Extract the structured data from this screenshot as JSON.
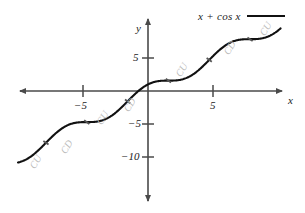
{
  "figure": {
    "title": "",
    "legend": {
      "label": "x + cos x",
      "swatch_color": "#111111",
      "position": "top-right"
    },
    "axes": {
      "x_label": "x",
      "y_label": "y",
      "x_ticks": [
        {
          "value": -5,
          "label": "−5"
        },
        {
          "value": 5,
          "label": "5"
        }
      ],
      "y_ticks": [
        {
          "value": 5,
          "label": "5"
        },
        {
          "value": -5,
          "label": "−5"
        },
        {
          "value": -10,
          "label": "−10"
        }
      ],
      "origin_px": {
        "x": 148,
        "y": 91
      },
      "px_per_unit_x": 13.0,
      "px_per_unit_y": 6.6,
      "axis_color": "#4a4a4a",
      "arrowheads": [
        "left",
        "right",
        "up",
        "down"
      ]
    },
    "annotations": [
      {
        "text": "CU",
        "x": -8.6,
        "y": -10.9
      },
      {
        "text": "CD",
        "x": -6.2,
        "y": -8.6
      },
      {
        "text": "CU",
        "x": -3.5,
        "y": -4.2
      },
      {
        "text": "CD",
        "x": -1.4,
        "y": -2.3
      },
      {
        "text": "CU",
        "x": 2.6,
        "y": 3.1
      },
      {
        "text": "CD",
        "x": 6.3,
        "y": 6.4
      },
      {
        "text": "CU",
        "x": 9.1,
        "y": 9.2
      }
    ],
    "inflection_marks": [
      {
        "x": -7.85,
        "y": -7.85
      },
      {
        "x": -4.71,
        "y": -4.71
      },
      {
        "x": -1.57,
        "y": -1.57
      },
      {
        "x": 1.57,
        "y": 1.57
      },
      {
        "x": 4.71,
        "y": 4.71
      },
      {
        "x": 7.85,
        "y": 7.85
      }
    ]
  },
  "chart_data": {
    "type": "line",
    "title": "",
    "subtitle": "",
    "xlabel": "x",
    "ylabel": "y",
    "xlim": [
      -10.0,
      10.2
    ],
    "ylim": [
      -13.8,
      10.5
    ],
    "grid": false,
    "legend_position": "top-right",
    "xticks": [
      -5,
      5
    ],
    "xticklabels": [
      "−5",
      "5"
    ],
    "yticks": [
      5,
      -5,
      -10
    ],
    "yticklabels": [
      "5",
      "−5",
      "−10"
    ],
    "series": [
      {
        "name": "x + cos x",
        "color": "#111111",
        "formula": "y = x + cos(x)",
        "x": [
          -10.0,
          -9.5,
          -9.0,
          -8.5,
          -8.0,
          -7.5,
          -7.0,
          -6.5,
          -6.0,
          -5.5,
          -5.0,
          -4.5,
          -4.0,
          -3.5,
          -3.0,
          -2.5,
          -2.0,
          -1.5,
          -1.0,
          -0.5,
          0.0,
          0.5,
          1.0,
          1.5,
          2.0,
          2.5,
          3.0,
          3.5,
          4.0,
          4.5,
          5.0,
          5.5,
          6.0,
          6.5,
          7.0,
          7.5,
          8.0,
          8.5,
          9.0,
          9.5,
          10.0
        ],
        "y": [
          -10.84,
          -9.5,
          -9.91,
          -9.1,
          -8.15,
          -7.15,
          -6.25,
          -5.52,
          -5.04,
          -4.79,
          -4.72,
          -4.79,
          -4.65,
          -3.56,
          -2.01,
          -1.7,
          -2.42,
          -3.43,
          -4.01,
          -3.62,
          1.0,
          1.38,
          1.54,
          1.57,
          1.58,
          1.7,
          2.01,
          2.56,
          3.35,
          4.29,
          5.28,
          6.21,
          6.96,
          7.48,
          7.75,
          7.85,
          7.85,
          7.9,
          8.09,
          8.52,
          9.16
        ]
      }
    ],
    "annotation_labels": [
      "CU",
      "CD",
      "CU",
      "CD",
      "CU",
      "CD",
      "CU"
    ]
  }
}
